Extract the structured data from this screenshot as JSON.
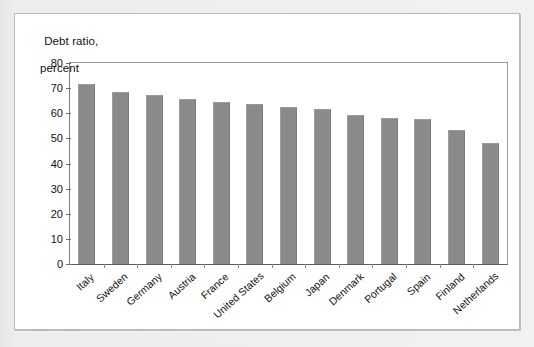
{
  "chart_data": {
    "type": "bar",
    "title": "Debt ratio, percent",
    "title_line1": "Debt ratio,",
    "title_line2": "percent",
    "xlabel": "",
    "ylabel": "Debt ratio, percent",
    "ylim": [
      0,
      80
    ],
    "yticks": [
      80,
      70,
      60,
      50,
      40,
      30,
      20,
      10,
      0
    ],
    "grid": false,
    "legend": null,
    "bar_color": "#8a8a8a",
    "categories": [
      "Italy",
      "Sweden",
      "Germany",
      "Austria",
      "France",
      "United States",
      "Belgium",
      "Japan",
      "Denmark",
      "Portugal",
      "Spain",
      "Finland",
      "Netherlands"
    ],
    "values": [
      71.5,
      68.5,
      67.3,
      65.5,
      64.5,
      63.5,
      62.5,
      61.5,
      59.5,
      58.0,
      57.6,
      53.5,
      48.3
    ]
  }
}
